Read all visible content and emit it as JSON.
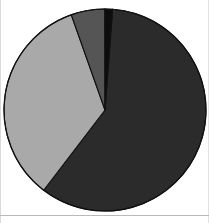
{
  "chart_data": {
    "type": "pie",
    "title": "",
    "subtitle": "",
    "xlabel": "",
    "ylabel": "",
    "grid": false,
    "legend": "none",
    "start_angle_deg": 0,
    "direction": "clockwise",
    "center": {
      "x": 105,
      "y": 110
    },
    "radius": 101,
    "labels": [
      "Slice 1",
      "Slice 2",
      "Slice 3",
      "Slice 4"
    ],
    "values": [
      59.2,
      34.2,
      5.4,
      1.2
    ],
    "percent_labels": [
      "59.2%",
      "34.2%",
      "5.4%",
      "1.2%"
    ],
    "colors": [
      "#2b2b2b",
      "#a9a9a9",
      "#555555",
      "#0d0d0d"
    ],
    "edge_color": "#111111",
    "slices": [
      {
        "label": "Slice 1",
        "value": 59.2,
        "percent_label": "59.2%",
        "color": "#2b2b2b",
        "start_deg": 4.3,
        "end_deg": 217.4
      },
      {
        "label": "Slice 2",
        "value": 34.2,
        "percent_label": "34.2%",
        "color": "#a9a9a9",
        "start_deg": 217.4,
        "end_deg": 340.5
      },
      {
        "label": "Slice 3",
        "value": 5.4,
        "percent_label": "5.4%",
        "color": "#555555",
        "start_deg": 340.5,
        "end_deg": 359.9
      },
      {
        "label": "Slice 4",
        "value": 1.2,
        "percent_label": "1.2%",
        "color": "#0d0d0d",
        "start_deg": 359.9,
        "end_deg": 364.3
      }
    ]
  },
  "figure": {
    "background": "#ffffff",
    "frame_color": "#b9b9b9",
    "width": 209,
    "height": 223
  }
}
